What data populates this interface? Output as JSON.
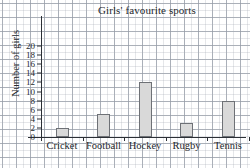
{
  "chart_data": {
    "type": "bar",
    "title": "Girls' favourite sports",
    "xlabel": "",
    "ylabel": "Number of girls",
    "categories": [
      "Cricket",
      "Football",
      "Hockey",
      "Rugby",
      "Tennis"
    ],
    "values": [
      2,
      5,
      12,
      3,
      8
    ],
    "ylim": [
      0,
      20
    ],
    "ytick_labels": [
      "0",
      "2",
      "4",
      "6",
      "8",
      "10",
      "12",
      "14",
      "16",
      "18",
      "20"
    ],
    "ytick_values": [
      0,
      2,
      4,
      6,
      8,
      10,
      12,
      14,
      16,
      18,
      20
    ],
    "grid": true,
    "legend": false,
    "bar_color": "#d9d9d9",
    "bar_edge_color": "#6e7176",
    "axis_color": "#2b2f35",
    "grid_color": "#78808e",
    "background_color": "#ffffff"
  }
}
